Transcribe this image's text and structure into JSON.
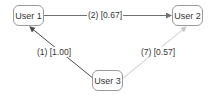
{
  "diagram": {
    "type": "directed-graph",
    "nodes": [
      {
        "id": "user1",
        "label": "User 1"
      },
      {
        "id": "user2",
        "label": "User 2"
      },
      {
        "id": "user3",
        "label": "User 3"
      }
    ],
    "edges": [
      {
        "from": "user1",
        "to": "user2",
        "label": "(2) [0.67]",
        "color": "#6f6f6f"
      },
      {
        "from": "user3",
        "to": "user1",
        "label": "(1) [1.00]",
        "color": "#4a4a4a"
      },
      {
        "from": "user3",
        "to": "user2",
        "label": "(7) [0.57]",
        "color": "#c8c8c8"
      }
    ]
  }
}
